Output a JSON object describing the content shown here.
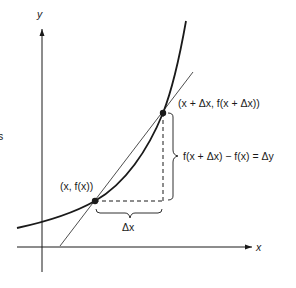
{
  "diagram": {
    "type": "secant-line-derivative-illustration",
    "axes": {
      "x_label": "x",
      "y_label": "y"
    },
    "points": {
      "lower": {
        "label": "(x, f(x))"
      },
      "upper": {
        "label": "(x + Δx, f(x + Δx))"
      }
    },
    "braces": {
      "horizontal_label": "Δx",
      "vertical_label": "f(x + Δx) − f(x) = Δy"
    },
    "edge_fragment": "s",
    "colors": {
      "ink": "#1a1a1a",
      "thin_line": "#3a3a3a",
      "background": "#ffffff"
    }
  }
}
